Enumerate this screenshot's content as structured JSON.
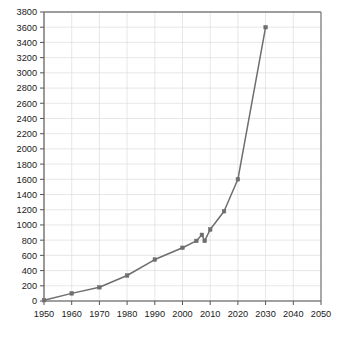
{
  "chart_data": {
    "type": "line",
    "title": "",
    "subtitle": "",
    "xlabel": "",
    "ylabel": "",
    "xlim": [
      1950,
      2050
    ],
    "ylim": [
      0,
      3800
    ],
    "grid": true,
    "legend": null,
    "legend_position": "none",
    "x_ticks": [
      1950,
      1960,
      1970,
      1980,
      1990,
      2000,
      2010,
      2020,
      2030,
      2040,
      2050
    ],
    "y_ticks": [
      0,
      200,
      400,
      600,
      800,
      1000,
      1200,
      1400,
      1600,
      1800,
      2000,
      2200,
      2400,
      2600,
      2800,
      3000,
      3200,
      3400,
      3600,
      3800
    ],
    "x_tick_labels": [
      "1950",
      "1960",
      "1970",
      "1980",
      "1990",
      "2000",
      "2010",
      "2020",
      "2030",
      "2040",
      "2050"
    ],
    "y_tick_labels": [
      "0",
      "200",
      "400",
      "600",
      "800",
      "1000",
      "1200",
      "1400",
      "1600",
      "1800",
      "2000",
      "2200",
      "2400",
      "2600",
      "2800",
      "3000",
      "3200",
      "3400",
      "3600",
      "3800"
    ],
    "series": [
      {
        "name": "series-1",
        "color": "#6e6e6e",
        "marker": "square",
        "x": [
          1950,
          1960,
          1970,
          1980,
          1990,
          2000,
          2005,
          2007,
          2008,
          2010,
          2015,
          2020,
          2030
        ],
        "y": [
          10,
          100,
          180,
          335,
          545,
          700,
          790,
          870,
          790,
          940,
          1180,
          1600,
          3600
        ]
      }
    ]
  },
  "style": {
    "line_color": "#6e6e6e",
    "marker_color": "#5a5a5a",
    "grid_color": "#dddddd",
    "axis_color": "#808080",
    "tick_color": "#555555",
    "background": "#ffffff"
  },
  "caption": {
    "text": ""
  }
}
